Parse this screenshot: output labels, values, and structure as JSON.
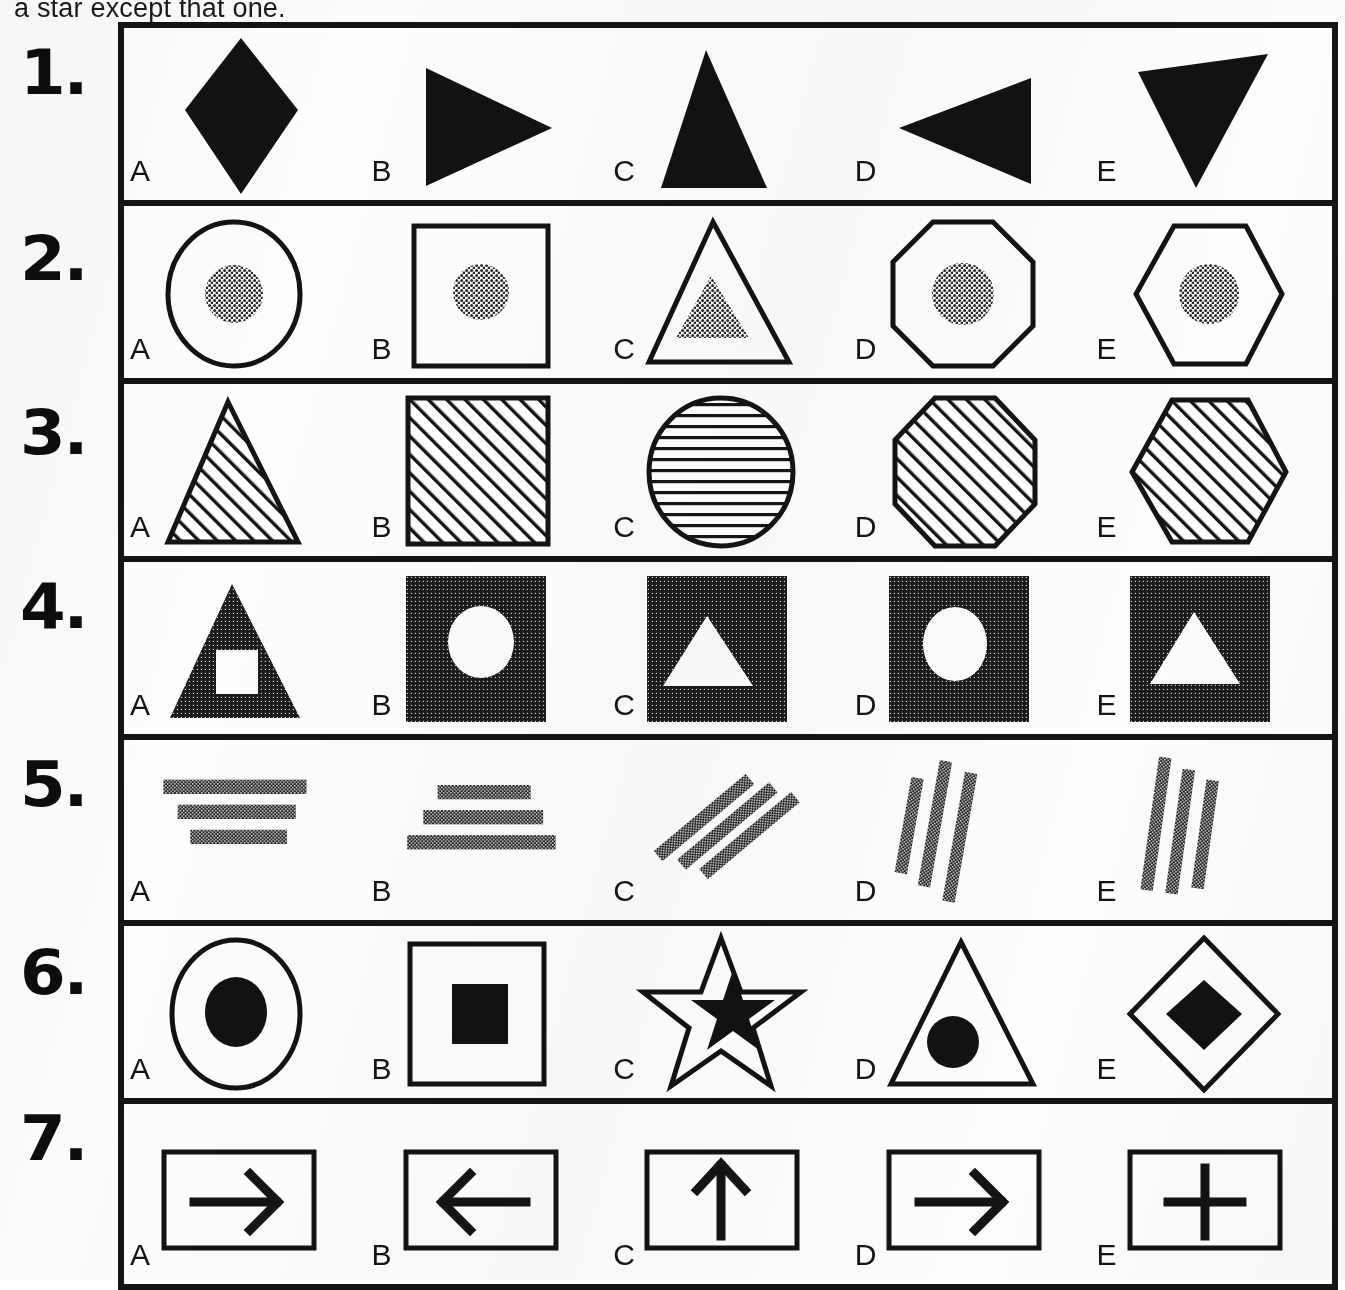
{
  "instruction": {
    "visible_text": "a star except that one."
  },
  "colors": {
    "ink": "#121212",
    "paper": "#fbfbf9",
    "halftone_gray": "#6d6d6d",
    "border": "#141414"
  },
  "option_letters": [
    "A",
    "B",
    "C",
    "D",
    "E"
  ],
  "rows": [
    {
      "number": "1.",
      "options": [
        {
          "letter": "A",
          "figure": "filled-diamond"
        },
        {
          "letter": "B",
          "figure": "filled-triangle-right"
        },
        {
          "letter": "C",
          "figure": "filled-triangle-up"
        },
        {
          "letter": "D",
          "figure": "filled-triangle-left"
        },
        {
          "letter": "E",
          "figure": "filled-triangle-down"
        }
      ]
    },
    {
      "number": "2.",
      "options": [
        {
          "letter": "A",
          "figure": "outline-circle-with-gray-circle"
        },
        {
          "letter": "B",
          "figure": "outline-square-with-gray-circle"
        },
        {
          "letter": "C",
          "figure": "outline-triangle-with-gray-triangle"
        },
        {
          "letter": "D",
          "figure": "outline-octagon-with-gray-circle"
        },
        {
          "letter": "E",
          "figure": "outline-hexagon-with-gray-circle"
        }
      ]
    },
    {
      "number": "3.",
      "options": [
        {
          "letter": "A",
          "figure": "hatched-triangle-diagonal"
        },
        {
          "letter": "B",
          "figure": "hatched-square-diagonal"
        },
        {
          "letter": "C",
          "figure": "hatched-circle-horizontal"
        },
        {
          "letter": "D",
          "figure": "hatched-octagon-diagonal"
        },
        {
          "letter": "E",
          "figure": "hatched-hexagon-diagonal"
        }
      ]
    },
    {
      "number": "4.",
      "options": [
        {
          "letter": "A",
          "figure": "dark-triangle-with-white-square"
        },
        {
          "letter": "B",
          "figure": "dark-square-with-white-circle"
        },
        {
          "letter": "C",
          "figure": "dark-square-with-white-triangle"
        },
        {
          "letter": "D",
          "figure": "dark-square-with-white-circle"
        },
        {
          "letter": "E",
          "figure": "dark-square-with-white-triangle"
        }
      ]
    },
    {
      "number": "5.",
      "options": [
        {
          "letter": "A",
          "figure": "three-horizontal-bars-narrowing-down"
        },
        {
          "letter": "B",
          "figure": "three-horizontal-bars-widening-down"
        },
        {
          "letter": "C",
          "figure": "three-diagonal-bars-leaning-right"
        },
        {
          "letter": "D",
          "figure": "three-steep-bars-leaning-left"
        },
        {
          "letter": "E",
          "figure": "three-steep-bars-leaning-left"
        }
      ]
    },
    {
      "number": "6.",
      "options": [
        {
          "letter": "A",
          "figure": "outline-circle-with-black-circle"
        },
        {
          "letter": "B",
          "figure": "outline-square-with-black-square"
        },
        {
          "letter": "C",
          "figure": "outline-star-with-black-star"
        },
        {
          "letter": "D",
          "figure": "outline-triangle-with-black-circle"
        },
        {
          "letter": "E",
          "figure": "outline-diamond-with-black-diamond"
        }
      ]
    },
    {
      "number": "7.",
      "options": [
        {
          "letter": "A",
          "figure": "boxed-arrow-right"
        },
        {
          "letter": "B",
          "figure": "boxed-arrow-left"
        },
        {
          "letter": "C",
          "figure": "boxed-arrow-up"
        },
        {
          "letter": "D",
          "figure": "boxed-arrow-right"
        },
        {
          "letter": "E",
          "figure": "boxed-plus"
        }
      ]
    }
  ]
}
